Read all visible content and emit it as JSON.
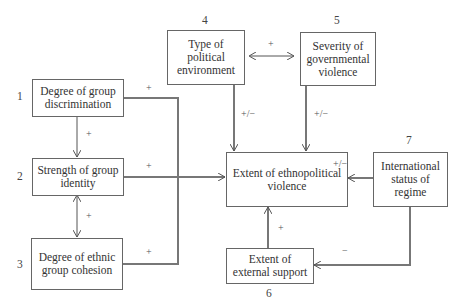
{
  "diagram": {
    "type": "causal-model",
    "nodes": [
      {
        "id": "1",
        "number": "1",
        "label": "Degree of group discrimination"
      },
      {
        "id": "2",
        "number": "2",
        "label": "Strength of group identity"
      },
      {
        "id": "3",
        "number": "3",
        "label": "Degree of ethnic group cohesion"
      },
      {
        "id": "4",
        "number": "4",
        "label": "Type of political environment"
      },
      {
        "id": "5",
        "number": "5",
        "label": "Severity of governmental violence"
      },
      {
        "id": "6",
        "number": "6",
        "label": "Extent of external support"
      },
      {
        "id": "7",
        "number": "7",
        "label": "International status of regime"
      },
      {
        "id": "center",
        "number": "",
        "label": "Extent of ethnopolitical violence"
      }
    ],
    "edges": [
      {
        "from": "1",
        "to": "2",
        "sign": "+"
      },
      {
        "from": "2",
        "to": "3",
        "sign": "+",
        "bidirectional": true
      },
      {
        "from": "1",
        "to": "center",
        "sign": "+"
      },
      {
        "from": "2",
        "to": "center",
        "sign": "+"
      },
      {
        "from": "3",
        "to": "center",
        "sign": "+"
      },
      {
        "from": "4",
        "to": "5",
        "sign": "+",
        "bidirectional": true
      },
      {
        "from": "4",
        "to": "center",
        "sign": "+/−"
      },
      {
        "from": "5",
        "to": "center",
        "sign": "+/−"
      },
      {
        "from": "7",
        "to": "center",
        "sign": "+/−"
      },
      {
        "from": "7",
        "to": "6",
        "sign": "−"
      },
      {
        "from": "6",
        "to": "center",
        "sign": "+"
      }
    ]
  },
  "labels": {
    "n1": "1",
    "n2": "2",
    "n3": "3",
    "n4": "4",
    "n5": "5",
    "n6": "6",
    "n7": "7",
    "box1": "Degree of group discrimination",
    "box2": "Strength of group identity",
    "box3": "Degree of ethnic group cohesion",
    "box4": "Type of political environment",
    "box5": "Severity of governmental violence",
    "box6": "Extent of external support",
    "box7": "International status of regime",
    "center": "Extent of ethnopolitical violence",
    "s_1_2": "+",
    "s_2_3": "+",
    "s_1_c": "+",
    "s_2_c": "+",
    "s_3_c": "+",
    "s_4_5": "+",
    "s_4_c": "+/−",
    "s_5_c": "+/−",
    "s_7_c": "+/−",
    "s_7_6": "−",
    "s_6_c": "+"
  }
}
